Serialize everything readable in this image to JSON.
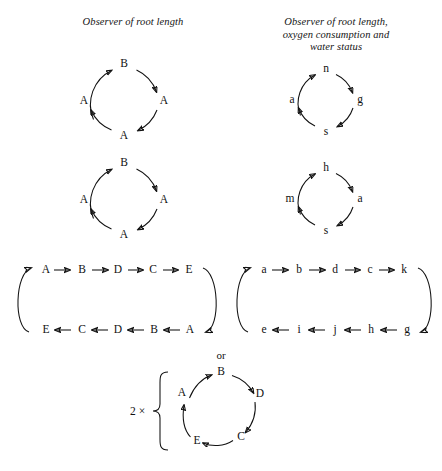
{
  "figure": {
    "headings": {
      "left": [
        "Observer of root length"
      ],
      "right": [
        "Observer of root length,",
        "oxygen consumption and",
        "water status"
      ]
    },
    "or_label": "or",
    "multiplier_label": "2 ×",
    "cycles": [
      {
        "id": "cycle-1-left",
        "nodes": [
          {
            "pos": "top",
            "label": "B"
          },
          {
            "pos": "right",
            "label": "A"
          },
          {
            "pos": "bottom",
            "label": "A"
          },
          {
            "pos": "left",
            "label": "A"
          }
        ],
        "direction": "clockwise"
      },
      {
        "id": "cycle-1-right",
        "nodes": [
          {
            "pos": "top",
            "label": "n"
          },
          {
            "pos": "right",
            "label": "g"
          },
          {
            "pos": "bottom",
            "label": "s"
          },
          {
            "pos": "left",
            "label": "a"
          }
        ],
        "direction": "clockwise"
      },
      {
        "id": "cycle-2-left",
        "nodes": [
          {
            "pos": "top",
            "label": "B"
          },
          {
            "pos": "right",
            "label": "A"
          },
          {
            "pos": "bottom",
            "label": "A"
          },
          {
            "pos": "left",
            "label": "A"
          }
        ],
        "direction": "clockwise"
      },
      {
        "id": "cycle-2-right",
        "nodes": [
          {
            "pos": "top",
            "label": "h"
          },
          {
            "pos": "right",
            "label": "a"
          },
          {
            "pos": "bottom",
            "label": "s"
          },
          {
            "pos": "left",
            "label": "m"
          }
        ],
        "direction": "clockwise"
      }
    ],
    "loops": [
      {
        "id": "loop-left",
        "top_row": [
          "A",
          "B",
          "D",
          "C",
          "E"
        ],
        "bottom_row": [
          "E",
          "C",
          "D",
          "B",
          "A"
        ],
        "top_direction": "right",
        "bottom_direction": "left"
      },
      {
        "id": "loop-right",
        "top_row": [
          "a",
          "b",
          "d",
          "c",
          "k"
        ],
        "bottom_row": [
          "e",
          "i",
          "j",
          "h",
          "g"
        ],
        "top_direction": "right",
        "bottom_direction": "left"
      }
    ],
    "pentagon_cycle": {
      "id": "cycle-bottom",
      "nodes": [
        {
          "pos": "left",
          "label": "A"
        },
        {
          "pos": "top",
          "label": "B"
        },
        {
          "pos": "right",
          "label": "D"
        },
        {
          "pos": "lower-right",
          "label": "C"
        },
        {
          "pos": "lower-left",
          "label": "E"
        }
      ],
      "direction": "clockwise"
    },
    "colors": {
      "ink": "#111111",
      "background": "#ffffff"
    }
  }
}
